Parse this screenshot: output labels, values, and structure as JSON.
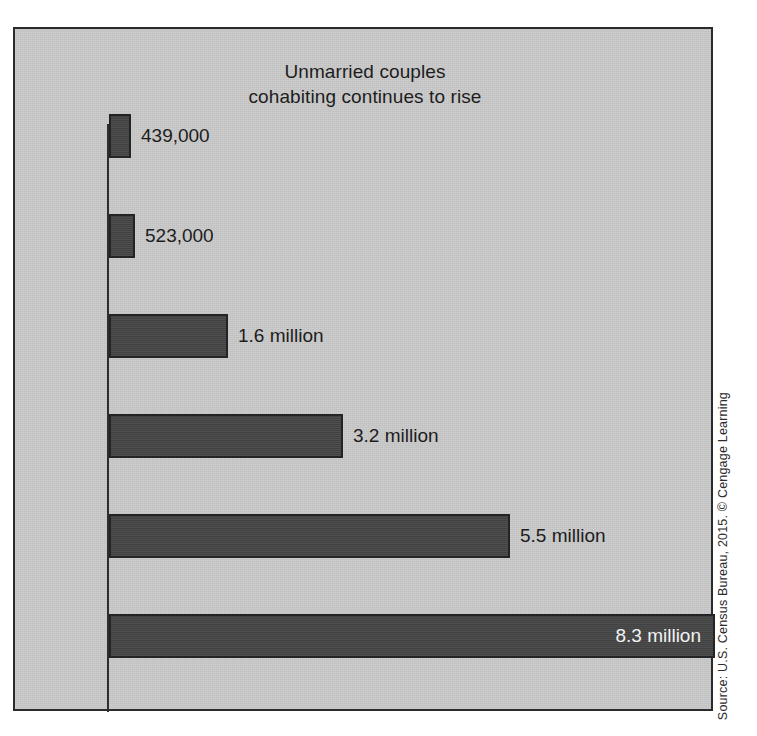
{
  "figure": {
    "source_credit": "Source: U.S. Census Bureau, 2015. © Cengage Learning",
    "background_color": "#c9c9c9",
    "bar_color": "#454545",
    "border_color": "#2b2b2b",
    "text_color": "#1d1d1d",
    "inside_label_color": "#f2f2f2"
  },
  "chart_data": {
    "type": "bar",
    "orientation": "horizontal",
    "title": "Unmarried couples cohabiting continues to rise",
    "title_lines": [
      "Unmarried couples",
      "cohabiting continues to rise"
    ],
    "xlabel": "",
    "ylabel": "",
    "categories": [
      "1960",
      "1970",
      "1980",
      "1990",
      "2000",
      "2015"
    ],
    "values": [
      439000,
      523000,
      1600000,
      3200000,
      5500000,
      8300000
    ],
    "value_labels": [
      "439,000",
      "523,000",
      "1.6 million",
      "3.2 million",
      "5.5 million",
      "8.3 million"
    ],
    "label_placement": [
      "outside",
      "outside",
      "outside",
      "outside",
      "outside",
      "inside"
    ],
    "xlim": [
      0,
      8300000
    ],
    "grid": false,
    "legend": false,
    "bars": [
      {
        "category": "1960",
        "value": 439000,
        "value_label": "439,000",
        "bar_px_width": 22,
        "row_top_px": 85,
        "label_placement": "outside"
      },
      {
        "category": "1970",
        "value": 523000,
        "value_label": "523,000",
        "bar_px_width": 26,
        "row_top_px": 185,
        "label_placement": "outside"
      },
      {
        "category": "1980",
        "value": 1600000,
        "value_label": "1.6 million",
        "bar_px_width": 119,
        "row_top_px": 285,
        "label_placement": "outside"
      },
      {
        "category": "1990",
        "value": 3200000,
        "value_label": "3.2 million",
        "bar_px_width": 234,
        "row_top_px": 385,
        "label_placement": "outside"
      },
      {
        "category": "2000",
        "value": 5500000,
        "value_label": "5.5 million",
        "bar_px_width": 401,
        "row_top_px": 485,
        "label_placement": "outside"
      },
      {
        "category": "2015",
        "value": 8300000,
        "value_label": "8.3 million",
        "bar_px_width": 606,
        "row_top_px": 585,
        "label_placement": "inside"
      }
    ]
  }
}
